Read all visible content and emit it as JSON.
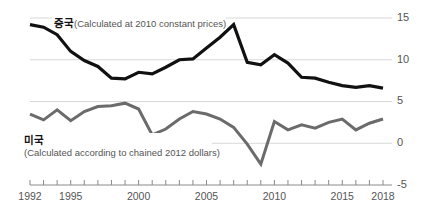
{
  "chart_data": {
    "type": "line",
    "title": "",
    "xlabel": "",
    "ylabel": "",
    "xlim": [
      1992,
      2018
    ],
    "ylim": [
      -5,
      15
    ],
    "yticks": [
      15,
      10,
      5,
      0,
      -5
    ],
    "ytick_labels": [
      "15",
      "10",
      "5",
      "0",
      "-5"
    ],
    "xticks": [
      1992,
      1995,
      2000,
      2005,
      2010,
      2015,
      2018
    ],
    "xtick_labels": [
      "1992",
      "1995",
      "2000",
      "2005",
      "2010",
      "2015",
      "2018"
    ],
    "x": [
      1992,
      1993,
      1994,
      1995,
      1996,
      1997,
      1998,
      1999,
      2000,
      2001,
      2002,
      2003,
      2004,
      2005,
      2006,
      2007,
      2008,
      2009,
      2010,
      2011,
      2012,
      2013,
      2014,
      2015,
      2016,
      2017,
      2018
    ],
    "grid": true,
    "legend_position": "inline-annotation",
    "series": [
      {
        "name": "China",
        "name_kr": "중국",
        "note": "(Calculated at 2010 constant prices)",
        "color": "#111111",
        "stroke_width": 3.2,
        "values": [
          14.2,
          13.9,
          13.0,
          11.0,
          9.9,
          9.2,
          7.8,
          7.7,
          8.5,
          8.3,
          9.1,
          10.0,
          10.1,
          11.4,
          12.7,
          14.2,
          9.7,
          9.4,
          10.6,
          9.6,
          7.9,
          7.8,
          7.3,
          6.9,
          6.7,
          6.9,
          6.6
        ]
      },
      {
        "name": "United States",
        "name_kr": "미국",
        "note": "(Calculated according to chained 2012 dollars)",
        "color": "#6b6b6b",
        "stroke_width": 3.0,
        "values": [
          3.5,
          2.8,
          4.0,
          2.7,
          3.8,
          4.4,
          4.5,
          4.8,
          4.1,
          1.0,
          1.7,
          2.9,
          3.8,
          3.5,
          2.9,
          1.9,
          -0.1,
          -2.5,
          2.6,
          1.6,
          2.2,
          1.8,
          2.5,
          2.9,
          1.6,
          2.4,
          2.9
        ]
      }
    ],
    "annotations": [
      {
        "id": "china-label",
        "text_kr": "중국",
        "text_en": "(Calculated at 2010 constant prices)"
      },
      {
        "id": "us-label",
        "text_kr": "미국",
        "text_en": "(Calculated according to chained 2012 dollars)"
      }
    ]
  }
}
